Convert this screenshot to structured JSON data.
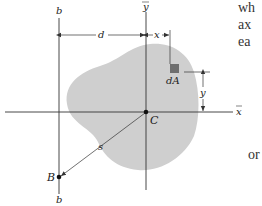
{
  "figure": {
    "labels": {
      "b_top": "b",
      "b_bottom": "b",
      "y_bar": "y",
      "x_bar": "x",
      "d": "d",
      "x": "x",
      "y": "y",
      "dA": "dA",
      "C": "C",
      "B": "B",
      "s": "s"
    },
    "colors": {
      "area_fill": "#cfcfcf",
      "element_fill": "#6e6e6e",
      "line": "#333333"
    }
  },
  "side_text": {
    "lines": [
      "wh",
      "ax",
      "ea"
    ],
    "bottom": "or"
  }
}
